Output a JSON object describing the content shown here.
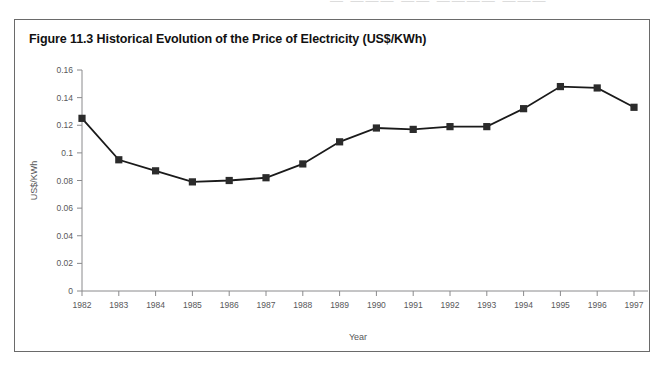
{
  "figure": {
    "title": "Figure 11.3 Historical Evolution of the Price of Electricity (US$/KWh)",
    "border_color": "#6a6a6a",
    "background": "#ffffff"
  },
  "axis": {
    "x_title": "Year",
    "y_title": "US$/KWh",
    "y_ticks": [
      "0",
      "0.02",
      "0.04",
      "0.06",
      "0.08",
      "0.1",
      "0.12",
      "0.14",
      "0.16"
    ],
    "x_ticks": [
      "1982",
      "1983",
      "1984",
      "1985",
      "1986",
      "1987",
      "1988",
      "1989",
      "1990",
      "1991",
      "1992",
      "1993",
      "1994",
      "1995",
      "1996",
      "1997"
    ],
    "axis_color": "#8a8a8c",
    "label_color": "#58585a"
  },
  "scan_artifact": {
    "text": "—  ———  ——  ————  ———"
  },
  "chart_data": {
    "type": "line",
    "title": "Figure 11.3 Historical Evolution of the Price of Electricity (US$/KWh)",
    "xlabel": "Year",
    "ylabel": "US$/KWh",
    "categories": [
      "1982",
      "1983",
      "1984",
      "1985",
      "1986",
      "1987",
      "1988",
      "1989",
      "1990",
      "1991",
      "1992",
      "1993",
      "1994",
      "1995",
      "1996",
      "1997"
    ],
    "values": [
      0.125,
      0.095,
      0.087,
      0.079,
      0.08,
      0.082,
      0.092,
      0.108,
      0.118,
      0.117,
      0.119,
      0.119,
      0.132,
      0.148,
      0.147,
      0.133
    ],
    "ylim": [
      0,
      0.16
    ],
    "ytick_step": 0.02,
    "grid": false,
    "legend": false,
    "marker": "square",
    "line_color": "#1a1a1a",
    "marker_color": "#2b2b2b"
  }
}
